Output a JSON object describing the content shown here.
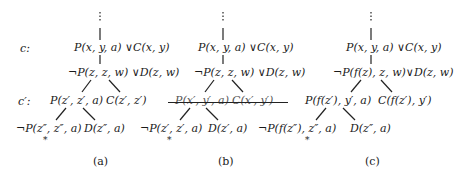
{
  "row_labels": {
    "c": "c:",
    "c_prime": "c′:"
  },
  "panels": [
    {
      "caption": "(a)",
      "root": "P(x, y, a) ∨C(x, y)",
      "child": "¬P(z, z, w) ∨D(z, w)",
      "level2": [
        "P(z′, z′, a)",
        "C(z′, z′)"
      ],
      "level3": [
        "¬P(z″, z″, a)",
        "D(z″, a)"
      ],
      "struck": false,
      "marker": "*"
    },
    {
      "caption": "(b)",
      "root": "P(x, y, a) ∨C(x, y)",
      "child": "¬P(z, z, w) ∨D(z, w)",
      "level2": [
        "P(x′, y′, a)",
        "C(x′, y′)"
      ],
      "level3": [
        "¬P(z′, z′, a)",
        "D(z′, a)"
      ],
      "struck": true,
      "marker": "*"
    },
    {
      "caption": "(c)",
      "root": "P(x, y, a) ∨C(x, y)",
      "child": "¬P(f(z), z, w)∨D(z, w)",
      "level2": [
        "P(f(z′), y′, a)",
        "C(f(z′), y′)"
      ],
      "level3": [
        "¬P(f(z″), z″, a)",
        "D(z″, a)"
      ],
      "struck": false,
      "marker": "*"
    }
  ],
  "ellipsis": "⋮"
}
